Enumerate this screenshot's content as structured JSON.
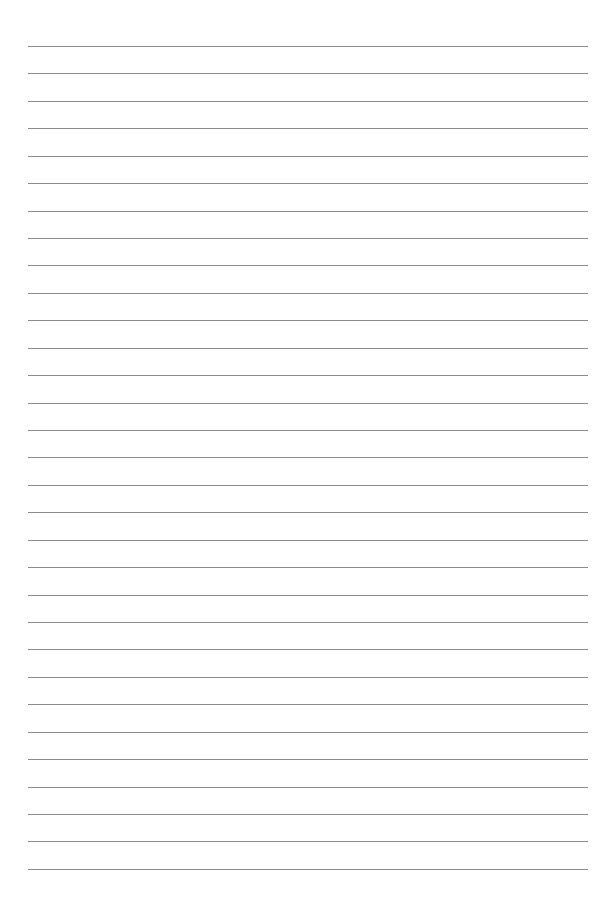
{
  "page": {
    "type": "lined-paper",
    "background_color": "#ffffff",
    "line_color": "#8c8c8c",
    "line_count": 31,
    "first_line_y": 46,
    "line_spacing": 27.43,
    "line_left": 28,
    "line_right": 588,
    "text": ""
  }
}
